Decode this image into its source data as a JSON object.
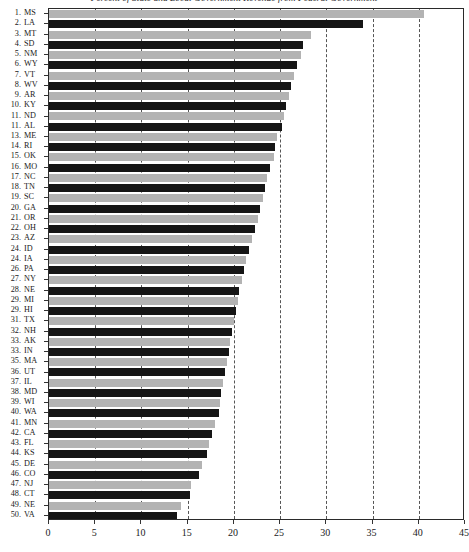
{
  "chart_data": {
    "type": "bar",
    "orientation": "horizontal",
    "title": "Percent of State and Local Government Revenue from Federal Government",
    "xlabel": "",
    "ylabel": "",
    "xlim": [
      0,
      45
    ],
    "xticks": [
      0,
      5,
      10,
      15,
      20,
      25,
      30,
      35,
      40,
      45
    ],
    "xtick_labels": [
      "0",
      "5",
      "10",
      "15",
      "20",
      "25",
      "30",
      "35",
      "40",
      "45"
    ],
    "grid": "vertical dashed gridlines at every tick",
    "legend": "none",
    "bar_colors": {
      "light": "#b3b3b3",
      "dark": "#151515"
    },
    "categories": [
      "MS",
      "LA",
      "MT",
      "SD",
      "NM",
      "WY",
      "VT",
      "WV",
      "AR",
      "KY",
      "ND",
      "AL",
      "ME",
      "RI",
      "OK",
      "MO",
      "NC",
      "TN",
      "SC",
      "GA",
      "OR",
      "OH",
      "AZ",
      "ID",
      "IA",
      "PA",
      "NY",
      "NE",
      "MI",
      "HI",
      "TX",
      "NH",
      "AK",
      "IN",
      "MA",
      "UT",
      "IL",
      "MD",
      "WI",
      "WA",
      "MN",
      "CA",
      "FL",
      "KS",
      "DE",
      "CO",
      "NJ",
      "CT",
      "NE",
      "VA"
    ],
    "rank_labels": [
      "1.",
      "2.",
      "3.",
      "4.",
      "5.",
      "6.",
      "7.",
      "8.",
      "9.",
      "10.",
      "11.",
      "11.",
      "13.",
      "14.",
      "15.",
      "16.",
      "17.",
      "18.",
      "19.",
      "20.",
      "21.",
      "22.",
      "23.",
      "24.",
      "24.",
      "26.",
      "27.",
      "28.",
      "29.",
      "29.",
      "31.",
      "32.",
      "33.",
      "33.",
      "35.",
      "36.",
      "37.",
      "38.",
      "39.",
      "40.",
      "41.",
      "42.",
      "43.",
      "44.",
      "45.",
      "46.",
      "47.",
      "48.",
      "49.",
      "50."
    ],
    "values": [
      40.6,
      34.0,
      28.3,
      27.5,
      27.3,
      26.8,
      26.5,
      26.2,
      26.0,
      25.6,
      25.4,
      25.2,
      24.7,
      24.5,
      24.3,
      23.9,
      23.6,
      23.4,
      23.2,
      22.8,
      22.6,
      22.3,
      22.0,
      21.6,
      21.3,
      21.1,
      20.9,
      20.6,
      20.4,
      20.2,
      20.0,
      19.8,
      19.6,
      19.5,
      19.3,
      19.0,
      18.8,
      18.6,
      18.5,
      18.4,
      18.0,
      17.6,
      17.3,
      17.1,
      16.5,
      16.2,
      15.4,
      15.2,
      14.3,
      13.8
    ],
    "bar_styles": [
      "light",
      "dark",
      "light",
      "dark",
      "light",
      "dark",
      "light",
      "dark",
      "light",
      "dark",
      "light",
      "dark",
      "light",
      "dark",
      "light",
      "dark",
      "light",
      "dark",
      "light",
      "dark",
      "light",
      "dark",
      "light",
      "dark",
      "light",
      "dark",
      "light",
      "dark",
      "light",
      "dark",
      "light",
      "dark",
      "light",
      "dark",
      "light",
      "dark",
      "light",
      "dark",
      "light",
      "dark",
      "light",
      "dark",
      "light",
      "dark",
      "light",
      "dark",
      "light",
      "dark",
      "light",
      "dark"
    ]
  }
}
